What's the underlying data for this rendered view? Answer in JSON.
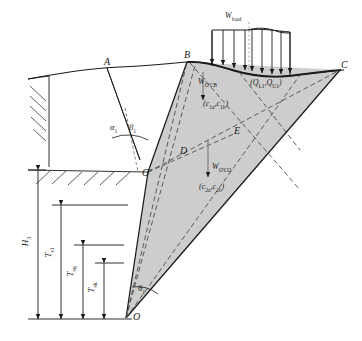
{
  "figure": {
    "type": "engineering-diagram",
    "background_color": "#ffffff",
    "line_color": "#1a1a1a",
    "wedge_fill_color": "#c9c9c9",
    "dashed_color": "#555555"
  },
  "vertices": [
    {
      "id": "A",
      "label": "A",
      "x": 107,
      "y": 65
    },
    {
      "id": "B",
      "label": "B",
      "x": 187,
      "y": 62
    },
    {
      "id": "C",
      "label": "C",
      "x": 340,
      "y": 70
    },
    {
      "id": "D",
      "label": "D",
      "x": 183,
      "y": 153
    },
    {
      "id": "E",
      "label": "E",
      "x": 236,
      "y": 133
    },
    {
      "id": "Op",
      "label": "O'",
      "x": 148,
      "y": 172
    },
    {
      "id": "O",
      "label": "O",
      "x": 126,
      "y": 318
    }
  ],
  "angles": [
    {
      "id": "alpha1",
      "label": "α",
      "sub": "1",
      "x": 114,
      "y": 128
    },
    {
      "id": "beta1",
      "label": "β",
      "sub": "1",
      "x": 133,
      "y": 128
    },
    {
      "id": "theta1",
      "label": "θ",
      "sub": "1",
      "x": 122,
      "y": 289
    }
  ],
  "forces": [
    {
      "id": "w_load",
      "label": "W",
      "sub": "load",
      "x": 228,
      "y": 14
    },
    {
      "id": "w_ocb",
      "label": "W",
      "sub": "O'CB",
      "x": 205,
      "y": 82
    },
    {
      "id": "q_pair",
      "label": "(Q",
      "sub": "L1",
      "label2": ",Q",
      "sub2": "U1",
      "label3": ")",
      "x": 252,
      "y": 83
    },
    {
      "id": "c1_pair",
      "label": "(c",
      "sub": "1a",
      "label2": ",c",
      "sub2": "1b",
      "label3": ")",
      "x": 206,
      "y": 104
    },
    {
      "id": "w_oco",
      "label": "W",
      "sub": "O'CO",
      "x": 212,
      "y": 167
    },
    {
      "id": "c2_pair",
      "label": "(c",
      "sub": "2a",
      "label2": ",c",
      "sub2": "2b",
      "label3": ")",
      "x": 199,
      "y": 186
    }
  ],
  "dimensions": [
    {
      "id": "H3",
      "label": "H",
      "sub": "3",
      "x": 30,
      "y": 240,
      "rotated": true
    },
    {
      "id": "Ts1",
      "label": "T",
      "sub": "s1",
      "x": 53,
      "y": 250,
      "rotated": true
    },
    {
      "id": "Tsq",
      "label": "T",
      "sub": "sq",
      "x": 75,
      "y": 268,
      "rotated": true
    },
    {
      "id": "Tsk",
      "label": "T",
      "sub": "sk",
      "x": 96,
      "y": 283,
      "rotated": true
    }
  ],
  "load_distribution": {
    "description": "Distributed surcharge load applied on ground surface between B and C",
    "arrow_count": 9,
    "centerline_style": "dotted"
  }
}
